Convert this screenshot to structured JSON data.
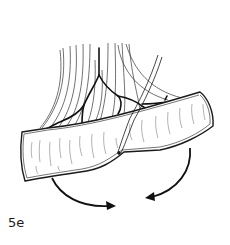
{
  "figure": {
    "label": "5e",
    "type": "surgical-illustration",
    "elements": [
      "tendon-bundle",
      "vessel-branches",
      "tissue-flap",
      "suture-line",
      "rotation-arrow-left",
      "rotation-arrow-right"
    ],
    "colors": {
      "line": "#1a1a1a",
      "background": "#ffffff",
      "flap_fill": "#ffffff"
    }
  }
}
